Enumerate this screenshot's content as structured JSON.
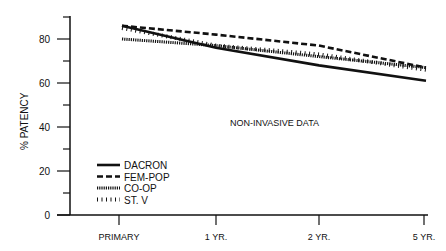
{
  "chart_data": {
    "type": "line",
    "title": "",
    "annotation": "NON-INVASIVE DATA",
    "xlabel": "",
    "ylabel": "% PATENCY",
    "ylim": [
      0,
      90
    ],
    "yticks": [
      0,
      20,
      40,
      60,
      80
    ],
    "categories": [
      "PRIMARY",
      "1 YR.",
      "2 YR.",
      "5 YR."
    ],
    "series": [
      {
        "name": "DACRON",
        "style": "solid",
        "values": [
          86,
          76,
          68,
          61
        ]
      },
      {
        "name": "FEM-POP",
        "style": "dashed",
        "values": [
          86,
          82,
          77,
          67
        ]
      },
      {
        "name": "CO-OP",
        "style": "dotted",
        "values": [
          80,
          77,
          72,
          67
        ]
      },
      {
        "name": "ST. V",
        "style": "hatched",
        "values": [
          85,
          77,
          73,
          66
        ]
      }
    ],
    "legend_position": "lower-left",
    "grid": false
  }
}
